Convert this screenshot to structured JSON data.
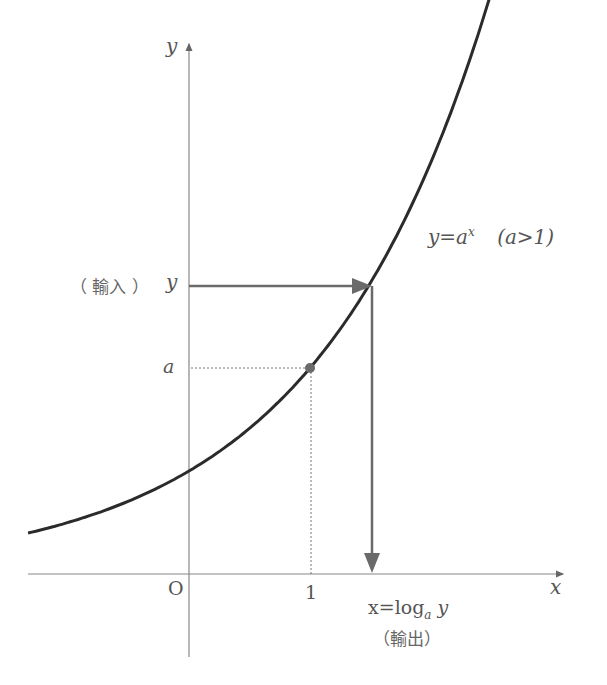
{
  "labels": {
    "y_axis": "y",
    "x_axis": "x",
    "origin": "O",
    "x_tick_one": "1",
    "y_tick_a": "a",
    "input_paren": "（ 輸入 ）",
    "input_var": "y",
    "curve_eq": "y=a",
    "curve_exp": "x",
    "curve_cond": "(a>1)",
    "output_eq_prefix": "x=log",
    "output_eq_sub": "a",
    "output_eq_var": "y",
    "output_paren": "（輸出）"
  },
  "colors": {
    "curve": "#2b2b2b",
    "arrows": "#6a6a6a",
    "axes": "#777777",
    "text": "#555555"
  },
  "chart_data": {
    "type": "line",
    "series": [
      {
        "name": "y=a^x",
        "function": "a^x",
        "a": 2,
        "x_range": [
          -1.33,
          2.48
        ]
      }
    ],
    "annotations": [
      {
        "point": [
          1,
          "a"
        ],
        "label": "(1, a)"
      },
      {
        "input": "y",
        "output": "x = log_a y"
      }
    ],
    "xlabel": "x",
    "ylabel": "y"
  }
}
